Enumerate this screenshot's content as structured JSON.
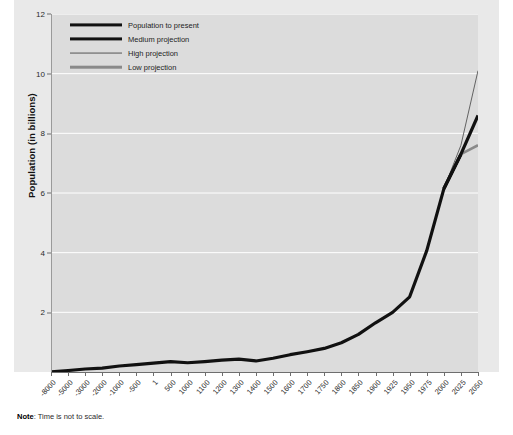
{
  "note": {
    "prefix": "Note",
    "separator": ": ",
    "text": "Time is not to scale."
  },
  "colors": {
    "plot_background": "#dcdcdc",
    "figure_background": "#e9e9e9",
    "gridline": "#ffffff",
    "population_to_present": "#111111",
    "medium_projection": "#111111",
    "high_projection": "#555555",
    "low_projection": "#8a8a8a",
    "axis": "#6e6e6e",
    "text": "#2b2b2b"
  },
  "legend": {
    "position": "top-left-inside",
    "items": [
      {
        "label": "Population to present",
        "style": "thick-solid",
        "color": "#111111",
        "width": 3.2
      },
      {
        "label": "Medium projection",
        "style": "thick-solid",
        "color": "#111111",
        "width": 3.2
      },
      {
        "label": "High projection",
        "style": "thin-solid",
        "color": "#555555",
        "width": 0.9
      },
      {
        "label": "Low projection",
        "style": "medium-solid",
        "color": "#8a8a8a",
        "width": 2.6
      }
    ]
  },
  "chart_data": {
    "type": "line",
    "title": "",
    "subtitle": "",
    "xlabel": "",
    "ylabel": "Population (in billions)",
    "ylim": [
      0,
      12
    ],
    "yticks": [
      2,
      4,
      6,
      8,
      10,
      12
    ],
    "ytick_labels": [
      "2",
      "4",
      "6",
      "8",
      "10",
      "12"
    ],
    "grid": true,
    "grid_axis": "y",
    "x_scale_note": "categorical / not to scale",
    "categories": [
      "-8000",
      "-5000",
      "-3000",
      "-2000",
      "-1000",
      "-500",
      "1",
      "500",
      "1000",
      "1100",
      "1200",
      "1300",
      "1400",
      "1500",
      "1600",
      "1700",
      "1750",
      "1800",
      "1850",
      "1900",
      "1925",
      "1950",
      "1975",
      "2000",
      "2025",
      "2050"
    ],
    "series": [
      {
        "name": "Population to present",
        "color": "#111111",
        "line_width": 3.2,
        "x": [
          "-8000",
          "-5000",
          "-3000",
          "-2000",
          "-1000",
          "-500",
          "1",
          "500",
          "1000",
          "1100",
          "1200",
          "1300",
          "1400",
          "1500",
          "1600",
          "1700",
          "1750",
          "1800",
          "1850",
          "1900",
          "1925",
          "1950",
          "1975",
          "2000",
          "2025"
        ],
        "values": [
          0.005,
          0.05,
          0.1,
          0.13,
          0.2,
          0.25,
          0.3,
          0.35,
          0.31,
          0.35,
          0.4,
          0.43,
          0.37,
          0.46,
          0.58,
          0.68,
          0.79,
          0.98,
          1.26,
          1.65,
          2.0,
          2.52,
          4.07,
          6.14,
          7.3
        ]
      },
      {
        "name": "Medium projection",
        "color": "#111111",
        "line_width": 3.2,
        "x": [
          "2000",
          "2025",
          "2050"
        ],
        "values": [
          6.14,
          7.3,
          8.6
        ]
      },
      {
        "name": "High projection",
        "color": "#555555",
        "line_width": 0.9,
        "x": [
          "2000",
          "2025",
          "2050"
        ],
        "values": [
          6.14,
          7.6,
          10.1
        ]
      },
      {
        "name": "Low projection",
        "color": "#8a8a8a",
        "line_width": 2.6,
        "x": [
          "2000",
          "2025",
          "2050"
        ],
        "values": [
          6.14,
          7.3,
          7.6
        ]
      }
    ]
  }
}
